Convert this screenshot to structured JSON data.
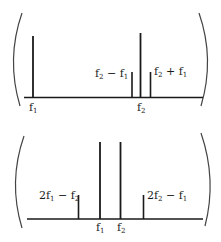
{
  "colors": {
    "ink": "#1a1a1a",
    "paren": "#444444",
    "background": "#ffffff"
  },
  "panels": [
    {
      "name": "input-spectrum",
      "baseline_label_positions": [
        "f1",
        "f2"
      ],
      "labels": {
        "f1": {
          "main": "f",
          "sub": "1"
        },
        "f2": {
          "main": "f",
          "sub": "2"
        },
        "diff": {
          "a": "f",
          "a_sub": "2",
          "op": " − ",
          "b": "f",
          "b_sub": "1"
        },
        "sum": {
          "a": "f",
          "a_sub": "2",
          "op": " + ",
          "b": "f",
          "b_sub": "1"
        }
      },
      "lines": [
        {
          "id": "f1",
          "x": 33,
          "top": 36,
          "kind": "tall"
        },
        {
          "id": "f2-f1",
          "x": 132,
          "top": 72,
          "kind": "short"
        },
        {
          "id": "f2",
          "x": 140,
          "top": 33,
          "kind": "tall"
        },
        {
          "id": "f2+f1",
          "x": 150,
          "top": 72,
          "kind": "short"
        }
      ]
    },
    {
      "name": "intermodulation-spectrum",
      "labels": {
        "f1": {
          "main": "f",
          "sub": "1"
        },
        "f2": {
          "main": "f",
          "sub": "2"
        },
        "lower_im": {
          "coef": "2",
          "a": "f",
          "a_sub": "1",
          "op": " − ",
          "b": "f",
          "b_sub": "2"
        },
        "upper_im": {
          "coef": "2",
          "a": "f",
          "a_sub": "2",
          "op": " − ",
          "b": "f",
          "b_sub": "1"
        }
      },
      "lines": [
        {
          "id": "2f1-f2",
          "x": 78,
          "top": 195,
          "kind": "short"
        },
        {
          "id": "f1",
          "x": 100,
          "top": 142,
          "kind": "tall"
        },
        {
          "id": "f2",
          "x": 120,
          "top": 142,
          "kind": "tall"
        },
        {
          "id": "2f2-f1",
          "x": 143,
          "top": 195,
          "kind": "short"
        }
      ]
    }
  ]
}
